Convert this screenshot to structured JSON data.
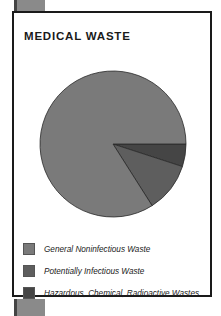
{
  "chart_data": {
    "type": "pie",
    "title": "MEDICAL WASTE",
    "categories": [
      "General Noninfectious Waste",
      "Potentially Infectious Waste",
      "Hazardous, Chemical, Radioactive Wastes"
    ],
    "values": [
      84,
      11,
      5
    ],
    "unit": "percent (estimated)",
    "colors": [
      "#7a7a7a",
      "#5e5e5e",
      "#454545"
    ],
    "legend_position": "bottom"
  },
  "legend": [
    {
      "label": "General Noninfectious Waste",
      "color": "#7a7a7a"
    },
    {
      "label": "Potentially Infectious Waste",
      "color": "#5e5e5e"
    },
    {
      "label": "Hazardous, Chemical, Radioactive Wastes",
      "color": "#454545"
    }
  ]
}
